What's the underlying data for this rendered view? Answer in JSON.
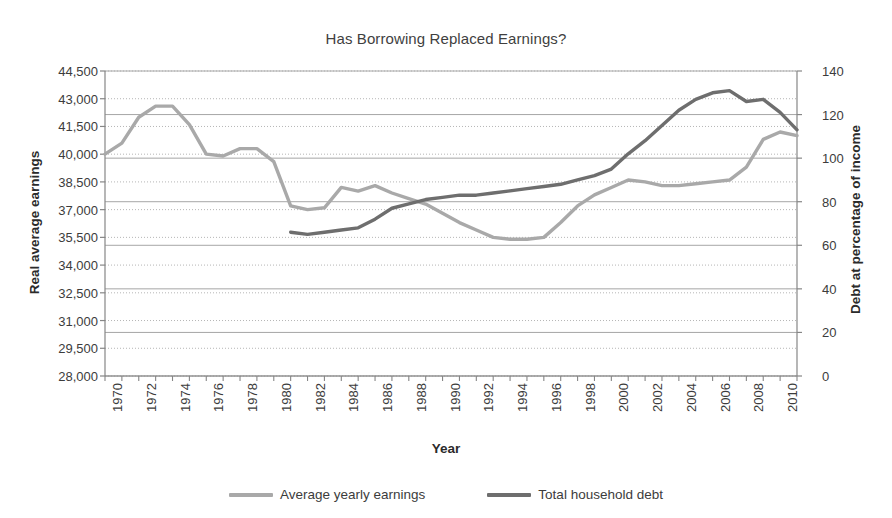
{
  "chart_data": {
    "type": "line",
    "title": "Has Borrowing Replaced Earnings?",
    "xlabel": "Year",
    "ylabel": "Real average earnings",
    "y2label": "Debt at percentage of income",
    "grid": true,
    "legend_position": "bottom",
    "xlim": [
      1970,
      2011
    ],
    "ylim": [
      28000,
      44500
    ],
    "y2lim": [
      0,
      140
    ],
    "ytick_step": 1500,
    "y2tick_step": 20,
    "xtick_step": 2,
    "xticks": [
      1970,
      1972,
      1974,
      1976,
      1978,
      1980,
      1982,
      1984,
      1986,
      1988,
      1990,
      1992,
      1994,
      1996,
      1998,
      2000,
      2002,
      2004,
      2006,
      2008,
      2010
    ],
    "yticks": [
      "28,000",
      "29,500",
      "31,000",
      "32,500",
      "34,000",
      "35,500",
      "37,000",
      "38,500",
      "40,000",
      "41,500",
      "43,000",
      "44,500"
    ],
    "y2ticks": [
      "0",
      "20",
      "40",
      "60",
      "80",
      "100",
      "120",
      "140"
    ],
    "series": [
      {
        "name": "Average yearly earnings",
        "color": "#a9a9a9",
        "axis": "left",
        "x": [
          1970,
          1971,
          1972,
          1973,
          1974,
          1975,
          1976,
          1977,
          1978,
          1979,
          1980,
          1981,
          1982,
          1983,
          1984,
          1985,
          1986,
          1987,
          1988,
          1989,
          1990,
          1991,
          1992,
          1993,
          1994,
          1995,
          1996,
          1997,
          1998,
          1999,
          2000,
          2001,
          2002,
          2003,
          2004,
          2005,
          2006,
          2007,
          2008,
          2009,
          2010,
          2011
        ],
        "values": [
          40000,
          40600,
          42000,
          42600,
          42600,
          41600,
          40000,
          39900,
          40300,
          40300,
          39600,
          37200,
          37000,
          37100,
          38200,
          38000,
          38300,
          37900,
          37600,
          37300,
          36800,
          36300,
          35900,
          35500,
          35400,
          35400,
          35500,
          36300,
          37200,
          37800,
          38200,
          38600,
          38500,
          38300,
          38300,
          38400,
          38500,
          38600,
          39300,
          40800,
          41200,
          41000
        ]
      },
      {
        "name": "Total household debt",
        "color": "#6e6e6e",
        "axis": "right",
        "x": [
          1981,
          1982,
          1983,
          1984,
          1985,
          1986,
          1987,
          1988,
          1989,
          1990,
          1991,
          1992,
          1993,
          1994,
          1995,
          1996,
          1997,
          1998,
          1999,
          2000,
          2001,
          2002,
          2003,
          2004,
          2005,
          2006,
          2007,
          2008,
          2009,
          2010,
          2011
        ],
        "values": [
          66,
          65,
          66,
          67,
          68,
          72,
          77,
          79,
          81,
          82,
          83,
          83,
          84,
          85,
          86,
          87,
          88,
          90,
          92,
          95,
          102,
          108,
          115,
          122,
          127,
          130,
          131,
          126,
          127,
          121,
          113
        ]
      }
    ]
  },
  "legend": {
    "items": [
      {
        "label": "Average yearly earnings",
        "color": "#a9a9a9"
      },
      {
        "label": "Total household debt",
        "color": "#6e6e6e"
      }
    ]
  },
  "colors": {
    "earnings_line": "#a9a9a9",
    "debt_line": "#6e6e6e",
    "gridline_solid": "#a6a6a6",
    "gridline_dotted": "#b5b5b5",
    "axis": "#868686",
    "text": "#3c3c3c",
    "background": "#ffffff"
  }
}
